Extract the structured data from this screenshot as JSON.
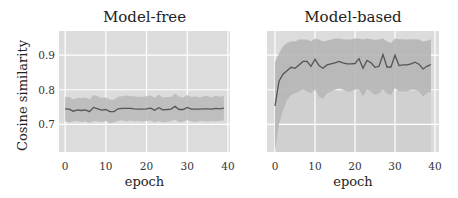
{
  "chart_data": [
    {
      "type": "line",
      "title": "Model-free",
      "xlabel": "epoch",
      "ylabel": "Cosine similarity",
      "xlim": [
        -1.5,
        40.5
      ],
      "ylim": [
        0.62,
        0.97
      ],
      "xticks": [
        0,
        10,
        20,
        30,
        40
      ],
      "xtick_labels": [
        "0",
        "10",
        "20",
        "30",
        "40"
      ],
      "yticks": [
        0.7,
        0.8,
        0.9
      ],
      "ytick_labels": [
        "0.7",
        "0.8",
        "0.9"
      ],
      "grid": true,
      "series": [
        {
          "name": "mean",
          "x": [
            0,
            1,
            2,
            3,
            4,
            5,
            6,
            7,
            8,
            9,
            10,
            11,
            12,
            13,
            14,
            15,
            16,
            17,
            18,
            19,
            20,
            21,
            22,
            23,
            24,
            25,
            26,
            27,
            28,
            29,
            30,
            31,
            32,
            33,
            34,
            35,
            36,
            37,
            38,
            39
          ],
          "values": [
            0.745,
            0.744,
            0.738,
            0.742,
            0.74,
            0.742,
            0.737,
            0.749,
            0.745,
            0.741,
            0.743,
            0.737,
            0.737,
            0.745,
            0.746,
            0.746,
            0.746,
            0.745,
            0.744,
            0.744,
            0.745,
            0.747,
            0.741,
            0.748,
            0.742,
            0.743,
            0.744,
            0.752,
            0.743,
            0.743,
            0.749,
            0.744,
            0.744,
            0.744,
            0.745,
            0.745,
            0.744,
            0.746,
            0.745,
            0.747
          ],
          "lower": [
            0.71,
            0.705,
            0.708,
            0.71,
            0.706,
            0.709,
            0.704,
            0.71,
            0.708,
            0.707,
            0.71,
            0.703,
            0.705,
            0.71,
            0.712,
            0.708,
            0.711,
            0.709,
            0.71,
            0.708,
            0.71,
            0.711,
            0.705,
            0.71,
            0.706,
            0.707,
            0.71,
            0.713,
            0.706,
            0.708,
            0.712,
            0.709,
            0.707,
            0.71,
            0.709,
            0.708,
            0.71,
            0.709,
            0.71,
            0.712
          ],
          "upper": [
            0.78,
            0.779,
            0.772,
            0.777,
            0.776,
            0.778,
            0.772,
            0.785,
            0.781,
            0.777,
            0.778,
            0.772,
            0.771,
            0.78,
            0.781,
            0.783,
            0.781,
            0.781,
            0.779,
            0.78,
            0.781,
            0.783,
            0.777,
            0.786,
            0.778,
            0.779,
            0.779,
            0.789,
            0.78,
            0.778,
            0.785,
            0.779,
            0.781,
            0.778,
            0.781,
            0.782,
            0.778,
            0.783,
            0.78,
            0.782
          ]
        }
      ]
    },
    {
      "type": "line",
      "title": "Model-based",
      "xlabel": "epoch",
      "ylabel": "",
      "xlim": [
        -2,
        41
      ],
      "ylim": [
        0.62,
        0.97
      ],
      "xticks": [
        0,
        10,
        20,
        30,
        40
      ],
      "xtick_labels": [
        "0",
        "10",
        "20",
        "30",
        "40"
      ],
      "yticks": [
        0.7,
        0.8,
        0.9
      ],
      "ytick_labels": [],
      "grid": true,
      "series": [
        {
          "name": "mean",
          "x": [
            0,
            1,
            2,
            3,
            4,
            5,
            6,
            7,
            8,
            9,
            10,
            11,
            12,
            13,
            14,
            15,
            16,
            17,
            18,
            19,
            20,
            21,
            22,
            23,
            24,
            25,
            26,
            27,
            28,
            29,
            30,
            31,
            32,
            33,
            34,
            35,
            36,
            37,
            38,
            39
          ],
          "values": [
            0.753,
            0.825,
            0.845,
            0.855,
            0.865,
            0.862,
            0.872,
            0.882,
            0.882,
            0.868,
            0.888,
            0.87,
            0.862,
            0.872,
            0.875,
            0.878,
            0.882,
            0.878,
            0.875,
            0.875,
            0.876,
            0.89,
            0.862,
            0.885,
            0.878,
            0.865,
            0.868,
            0.902,
            0.866,
            0.866,
            0.9,
            0.87,
            0.872,
            0.872,
            0.875,
            0.88,
            0.874,
            0.86,
            0.868,
            0.873
          ],
          "lower": [
            0.62,
            0.7,
            0.74,
            0.77,
            0.785,
            0.79,
            0.795,
            0.8,
            0.795,
            0.79,
            0.8,
            0.78,
            0.775,
            0.79,
            0.795,
            0.8,
            0.805,
            0.8,
            0.795,
            0.795,
            0.8,
            0.8,
            0.78,
            0.8,
            0.795,
            0.785,
            0.79,
            0.8,
            0.79,
            0.785,
            0.805,
            0.795,
            0.795,
            0.795,
            0.8,
            0.8,
            0.795,
            0.78,
            0.79,
            0.795
          ],
          "upper": [
            0.88,
            0.905,
            0.925,
            0.935,
            0.94,
            0.94,
            0.945,
            0.945,
            0.945,
            0.94,
            0.948,
            0.945,
            0.94,
            0.942,
            0.945,
            0.948,
            0.948,
            0.946,
            0.945,
            0.945,
            0.948,
            0.948,
            0.945,
            0.948,
            0.946,
            0.944,
            0.945,
            0.948,
            0.94,
            0.935,
            0.948,
            0.946,
            0.946,
            0.945,
            0.946,
            0.946,
            0.945,
            0.94,
            0.942,
            0.946
          ]
        }
      ]
    }
  ]
}
